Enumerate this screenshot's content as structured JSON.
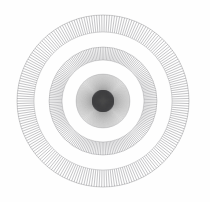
{
  "canvas": {
    "width": 210,
    "height": 202,
    "background_color": "#fefefe",
    "title": "Concentric radial guilloche pattern"
  },
  "figure": {
    "name": "radial-burst-rosette",
    "center_x": 103,
    "center_y": 101,
    "outer_radius": 86,
    "stroke_color": "#58585c",
    "ink_color": "#3a3a3e"
  },
  "chart_data": {
    "type": "scatter",
    "xlabel": "",
    "ylabel": "",
    "grid": false,
    "legend": null,
    "center": [
      103,
      101
    ],
    "bands": [
      {
        "name": "center-burst",
        "inner_radius": 0,
        "outer_radius": 11,
        "spoke_count": 360,
        "stroke_width": 0.55,
        "opacity": 0.85,
        "color": "#2e2e32"
      },
      {
        "name": "inner-disc",
        "inner_radius": 0,
        "outer_radius": 27,
        "spoke_count": 300,
        "stroke_width": 0.32,
        "opacity": 0.5,
        "color": "#4a4a4e"
      },
      {
        "name": "middle-ring",
        "inner_radius": 41,
        "outer_radius": 54,
        "spoke_count": 190,
        "stroke_width": 0.45,
        "opacity": 0.75,
        "color": "#55555a"
      },
      {
        "name": "outer-ring",
        "inner_radius": 69,
        "outer_radius": 86,
        "spoke_count": 210,
        "stroke_width": 0.45,
        "opacity": 0.75,
        "color": "#55555a"
      }
    ],
    "guide_circles": [
      {
        "name": "inner-disc-edge",
        "radius": 27,
        "stroke_width": 0.4,
        "opacity": 0.45,
        "color": "#5a5a5e"
      },
      {
        "name": "middle-ring-inner-edge",
        "radius": 41,
        "stroke_width": 0.4,
        "opacity": 0.6,
        "color": "#5a5a5e"
      },
      {
        "name": "middle-ring-outer-edge",
        "radius": 54,
        "stroke_width": 0.4,
        "opacity": 0.6,
        "color": "#5a5a5e"
      },
      {
        "name": "outer-ring-inner-edge",
        "radius": 69,
        "stroke_width": 0.4,
        "opacity": 0.6,
        "color": "#5a5a5e"
      },
      {
        "name": "outer-ring-outer-edge",
        "radius": 86,
        "stroke_width": 0.45,
        "opacity": 0.65,
        "color": "#5a5a5e"
      }
    ]
  }
}
